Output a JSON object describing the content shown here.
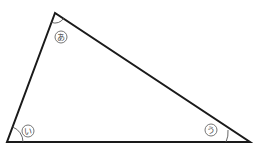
{
  "diagram": {
    "type": "triangle",
    "stroke_color": "#1a1a1a",
    "vertices": {
      "top": [
        55,
        13
      ],
      "bottom_left": [
        7,
        142
      ],
      "bottom_right": [
        250,
        142
      ]
    },
    "angles": [
      {
        "id": "a",
        "label": "あ",
        "vertex": "top",
        "label_pos": [
          61,
          37
        ]
      },
      {
        "id": "i",
        "label": "い",
        "vertex": "bottom_left",
        "label_pos": [
          28,
          131
        ]
      },
      {
        "id": "u",
        "label": "う",
        "vertex": "bottom_right",
        "label_pos": [
          211,
          130
        ]
      }
    ]
  }
}
